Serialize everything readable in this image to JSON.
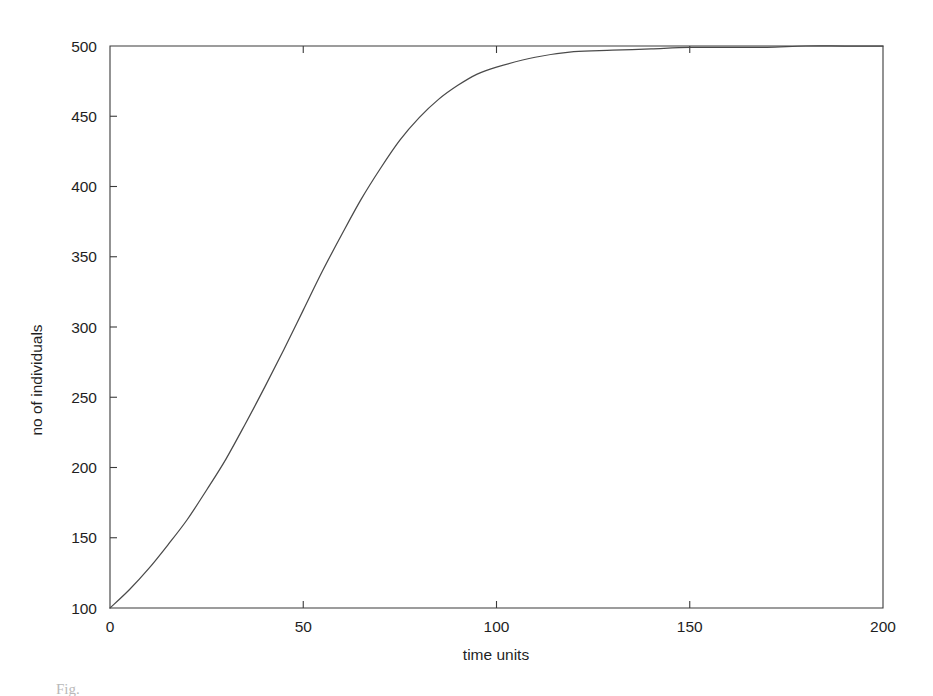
{
  "figure": {
    "background_color": "#ffffff",
    "line_color": "#4a4a4a",
    "axis_color": "#3b3b3b",
    "caption_partial": "Fig."
  },
  "chart_data": {
    "type": "line",
    "title": "",
    "subtitle": "",
    "xlabel": "time units",
    "ylabel": "no of individuals",
    "xlim": [
      0,
      200
    ],
    "ylim": [
      100,
      500
    ],
    "grid": false,
    "legend": false,
    "legend_position": "none",
    "xticks": [
      0,
      50,
      100,
      150,
      200
    ],
    "xticklabels": [
      "0",
      "50",
      "100",
      "150",
      "200"
    ],
    "yticks": [
      100,
      150,
      200,
      250,
      300,
      350,
      400,
      450,
      500
    ],
    "yticklabels": [
      "100",
      "150",
      "200",
      "250",
      "300",
      "350",
      "400",
      "450",
      "500"
    ],
    "annotations": [],
    "series": [
      {
        "name": "logistic growth",
        "x": [
          0,
          5,
          10,
          15,
          20,
          25,
          30,
          35,
          40,
          45,
          50,
          55,
          60,
          65,
          70,
          75,
          80,
          85,
          90,
          95,
          100,
          110,
          120,
          130,
          140,
          150,
          160,
          170,
          180,
          190,
          200
        ],
        "values": [
          100,
          113,
          128,
          145,
          163,
          184,
          206,
          231,
          257,
          284,
          312,
          340,
          366,
          391,
          413,
          433,
          449,
          462,
          472,
          480,
          485,
          492,
          496,
          497,
          498,
          499,
          499,
          499,
          500,
          500,
          500
        ]
      }
    ]
  },
  "axis_titles": {
    "x": "time units",
    "y": "no of individuals"
  }
}
